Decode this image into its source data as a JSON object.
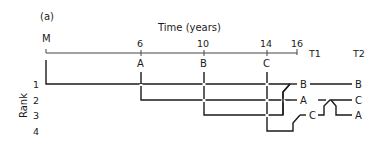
{
  "panel_label": "(a)",
  "axis": {
    "title": "Time (years)",
    "origin_label": "M",
    "ticks": [
      "6",
      "10",
      "14",
      "16"
    ],
    "event_labels": [
      "A",
      "B",
      "C"
    ]
  },
  "rank": {
    "title": "Rank",
    "levels": [
      "1",
      "2",
      "3",
      "4"
    ]
  },
  "columns": {
    "t1": "T1",
    "t2": "T2"
  },
  "t1_order": [
    "B",
    "A",
    "C"
  ],
  "t2_order": [
    "B",
    "C",
    "A"
  ]
}
